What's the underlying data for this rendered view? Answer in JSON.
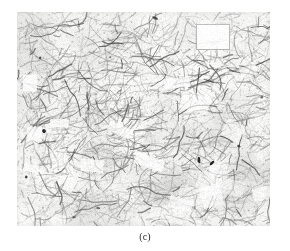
{
  "figure": {
    "caption": "(c)",
    "kind": "optical-micrograph",
    "frame": {
      "x": 17,
      "y": 12,
      "width": 253,
      "height": 214
    },
    "page_background": "#ffffff",
    "colors": {
      "matrix_light": "#fbfbfa",
      "matrix_mid": "#e6e6e4",
      "boundary_gray": "#8c8c8c",
      "boundary_dark": "#4a4a4a",
      "inclusion_black": "#1c1c1c",
      "caption_text": "#2b2b2b"
    },
    "texture": {
      "seed": 20240517,
      "filament_count": 1400,
      "speckle_count": 2600,
      "bright_patch_count": 26,
      "dark_inclusion_count": 7,
      "dominant_orientation_deg": -18,
      "bright_band_y_fraction": 0.34,
      "notable_bright_rect": {
        "x": 196,
        "y": 24,
        "width": 34,
        "height": 26
      },
      "notable_dark_spots": [
        {
          "x": 44,
          "y": 131
        },
        {
          "x": 199,
          "y": 160
        },
        {
          "x": 212,
          "y": 163
        },
        {
          "x": 155,
          "y": 18
        }
      ]
    }
  }
}
